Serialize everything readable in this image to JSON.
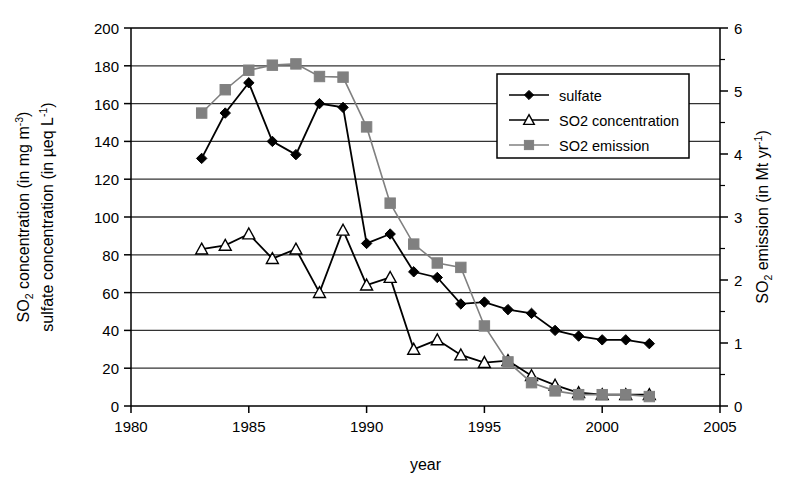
{
  "chart_data": {
    "type": "line",
    "title": "",
    "xlabel": "year",
    "ylabel_left_line1": "SO2 concentration (in mg m-3)",
    "ylabel_left_line2": "sulfate concentration (in µeq L-1)",
    "ylabel_right": "SO2 emission (in Mt yr-1)",
    "xlim": [
      1980,
      2005
    ],
    "xticks": [
      1980,
      1985,
      1990,
      1995,
      2000,
      2005
    ],
    "xtick_labels": [
      "1980",
      "1985",
      "1990",
      "1995",
      "2000",
      "2005"
    ],
    "ylim_left": [
      0,
      200
    ],
    "yticks_left": [
      0,
      20,
      40,
      60,
      80,
      100,
      120,
      140,
      160,
      180,
      200
    ],
    "ytick_labels_left": [
      "0",
      "20",
      "40",
      "60",
      "80",
      "100",
      "120",
      "140",
      "160",
      "180",
      "200"
    ],
    "ylim_right": [
      0,
      6
    ],
    "yticks_right": [
      0,
      1,
      2,
      3,
      4,
      5,
      6
    ],
    "ytick_labels_right": [
      "0",
      "1",
      "2",
      "3",
      "4",
      "5",
      "6"
    ],
    "yticks_right_minor": [
      0.5,
      1.5,
      2.5,
      3.5,
      4.5,
      5.5
    ],
    "grid": "horizontal",
    "legend_position": "upper-right-inside",
    "x": [
      1983,
      1984,
      1985,
      1986,
      1987,
      1988,
      1989,
      1990,
      1991,
      1992,
      1993,
      1994,
      1995,
      1996,
      1997,
      1998,
      1999,
      2000,
      2001,
      2002
    ],
    "series": [
      {
        "name": "sulfate",
        "axis": "left",
        "marker": "filled-diamond",
        "color": "#000000",
        "values": [
          131,
          155,
          171,
          140,
          133,
          160,
          158,
          86,
          91,
          71,
          68,
          54,
          55,
          51,
          49,
          40,
          37,
          35,
          35,
          33
        ]
      },
      {
        "name": "SO2 concentration",
        "axis": "left",
        "marker": "open-triangle",
        "color": "#000000",
        "values": [
          83,
          85,
          91,
          78,
          83,
          60,
          93,
          64,
          68,
          30,
          35,
          27,
          23,
          24,
          16,
          11,
          7,
          6,
          6,
          6
        ]
      },
      {
        "name": "SO2 emission",
        "axis": "right",
        "marker": "filled-square",
        "color": "#808080",
        "values": [
          4.65,
          5.02,
          5.33,
          5.41,
          5.43,
          5.23,
          5.22,
          4.43,
          3.22,
          2.57,
          2.27,
          2.2,
          1.27,
          0.7,
          0.37,
          0.24,
          0.18,
          0.18,
          0.18,
          0.15
        ]
      }
    ],
    "legend": [
      {
        "label": "sulfate",
        "marker": "filled-diamond",
        "color": "#000000"
      },
      {
        "label": "SO2 concentration",
        "marker": "open-triangle",
        "color": "#000000"
      },
      {
        "label": "SO2 emission",
        "marker": "filled-square",
        "color": "#808080"
      }
    ]
  },
  "axis_text": {
    "left_title_so2_main": "SO",
    "left_title_so2_sub": "2",
    "left_title_so2_rest": " concentration (in mg m",
    "left_title_so2_sup": "-3",
    "left_title_so2_close": ")",
    "left_title_sulfate_main": "sulfate concentration (in µeq L",
    "left_title_sulfate_sup": "-1",
    "left_title_sulfate_close": ")",
    "right_title_main": "SO",
    "right_title_sub": "2",
    "right_title_rest": " emission (in Mt yr",
    "right_title_sup": "-1",
    "right_title_close": ")",
    "xlabel": "year"
  },
  "colors": {
    "axis": "#000000",
    "grid": "#333333",
    "sulfate": "#000000",
    "so2_concentration": "#000000",
    "so2_emission": "#808080",
    "background": "#ffffff"
  }
}
